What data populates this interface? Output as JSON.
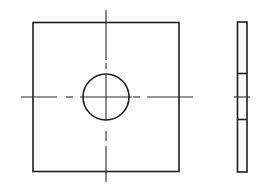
{
  "diagram": {
    "type": "technical-drawing",
    "line_color": "#1e1e1e",
    "background": "#ffffff",
    "views": [
      {
        "name": "front-view",
        "outline": {
          "x": 33,
          "y": 22.5,
          "width": 146,
          "height": 149
        },
        "hole": {
          "cx": 106,
          "cy": 97,
          "r": 23
        },
        "centerlines": {
          "horizontal": {
            "y": 97,
            "segments": [
              [
                21,
                57
              ],
              [
                66,
                73
              ],
              [
                80,
                132
              ],
              [
                133,
                140
              ],
              [
                147,
                193
              ]
            ]
          },
          "vertical": {
            "x": 106,
            "segments": [
              [
                10,
                60
              ],
              [
                63,
                69
              ],
              [
                74,
                120
              ],
              [
                131,
                141
              ],
              [
                146,
                182
              ]
            ]
          }
        }
      },
      {
        "name": "side-view",
        "outline": {
          "x": 237.5,
          "y": 22,
          "width": 9.5,
          "height": 150
        },
        "hidden_edges_y": [
          73.5,
          119.5
        ],
        "centerline": {
          "y": 97,
          "x1": 234,
          "x2": 250
        }
      }
    ]
  }
}
